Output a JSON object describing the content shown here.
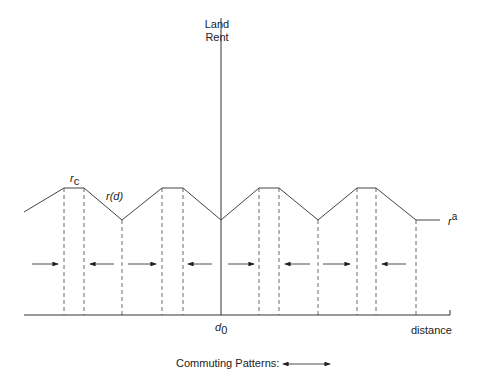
{
  "diagram": {
    "y_axis_label_line1": "Land",
    "y_axis_label_line2": "Rent",
    "x_axis_label": "distance",
    "center_label_main": "d",
    "center_label_sub": "0",
    "peak_label_main": "r",
    "peak_label_sub": "c",
    "curve_label": "r(d)",
    "agri_label_main": "r",
    "agri_label_sup": "a",
    "legend_label": "Commuting Patterns:"
  },
  "geometry": {
    "baseline_y": 315,
    "axis_x": 221,
    "peak_y": 188,
    "valley_y": 220,
    "curve_points": [
      [
        24,
        212
      ],
      [
        64,
        188
      ],
      [
        84,
        188
      ],
      [
        122,
        220
      ],
      [
        162,
        188
      ],
      [
        183,
        188
      ],
      [
        221,
        220
      ],
      [
        259,
        188
      ],
      [
        279,
        188
      ],
      [
        318,
        220
      ],
      [
        357,
        188
      ],
      [
        376,
        188
      ],
      [
        416,
        220
      ],
      [
        440,
        220
      ]
    ],
    "dashed_x": [
      64,
      84,
      122,
      162,
      183,
      259,
      279,
      318,
      357,
      376,
      416
    ],
    "arrows_y": 264,
    "arrows": [
      {
        "x1": 32,
        "x2": 58,
        "dir": "right"
      },
      {
        "x1": 90,
        "x2": 114,
        "dir": "left"
      },
      {
        "x1": 128,
        "x2": 156,
        "dir": "right"
      },
      {
        "x1": 188,
        "x2": 212,
        "dir": "left"
      },
      {
        "x1": 228,
        "x2": 254,
        "dir": "right"
      },
      {
        "x1": 285,
        "x2": 310,
        "dir": "left"
      },
      {
        "x1": 323,
        "x2": 350,
        "dir": "right"
      },
      {
        "x1": 382,
        "x2": 406,
        "dir": "left"
      }
    ]
  }
}
